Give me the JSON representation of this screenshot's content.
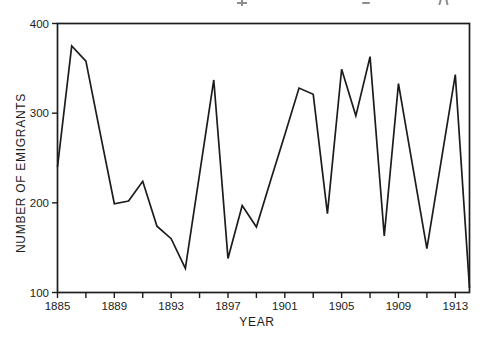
{
  "figure": {
    "background": "#ffffff",
    "ink": "#1c1c1c"
  },
  "chart_data": {
    "type": "line",
    "title": "",
    "xlabel": "YEAR",
    "ylabel": "NUMBER OF EMIGRANTS",
    "x_range": [
      1885,
      1914
    ],
    "ylim": [
      100,
      400
    ],
    "y_ticks": [
      100,
      200,
      300,
      400
    ],
    "x_tick_years": [
      1885,
      1887,
      1889,
      1891,
      1893,
      1895,
      1897,
      1899,
      1901,
      1903,
      1905,
      1907,
      1909,
      1911,
      1913
    ],
    "x_labeled_ticks": [
      1885,
      1889,
      1893,
      1897,
      1901,
      1905,
      1909,
      1913
    ],
    "grid": false,
    "legend": "none",
    "frame": "box",
    "line_color": "#1c1c1c",
    "years": [
      1885,
      1886,
      1887,
      1888,
      1889,
      1890,
      1891,
      1892,
      1893,
      1894,
      1895,
      1896,
      1897,
      1898,
      1899,
      1900,
      1901,
      1902,
      1903,
      1904,
      1905,
      1906,
      1907,
      1908,
      1909,
      1910,
      1911,
      1912,
      1913,
      1914
    ],
    "values": [
      240,
      375,
      358,
      278,
      199,
      202,
      224,
      174,
      160,
      127,
      232,
      337,
      138,
      197,
      173,
      225,
      276,
      328,
      321,
      188,
      349,
      297,
      363,
      163,
      333,
      241,
      149,
      246,
      343,
      105
    ]
  }
}
